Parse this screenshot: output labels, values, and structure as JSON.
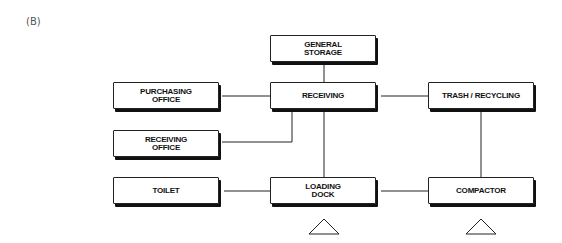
{
  "figure_label": "(B)",
  "nodes": {
    "general_storage": "GENERAL\nSTORAGE",
    "purchasing_office": "PURCHASING\nOFFICE",
    "receiving": "RECEIVING",
    "trash_recycling": "TRASH / RECYCLING",
    "receiving_office": "RECEIVING\nOFFICE",
    "toilet": "TOILET",
    "loading_dock": "LOADING\nDOCK",
    "compactor": "COMPACTOR"
  },
  "edges": [
    [
      "general_storage",
      "receiving"
    ],
    [
      "purchasing_office",
      "receiving"
    ],
    [
      "receiving",
      "trash_recycling"
    ],
    [
      "receiving",
      "receiving_office"
    ],
    [
      "receiving",
      "loading_dock"
    ],
    [
      "trash_recycling",
      "compactor"
    ],
    [
      "toilet",
      "loading_dock"
    ],
    [
      "loading_dock",
      "compactor"
    ]
  ],
  "markers": [
    "triangle-under-loading-dock",
    "triangle-under-compactor"
  ]
}
